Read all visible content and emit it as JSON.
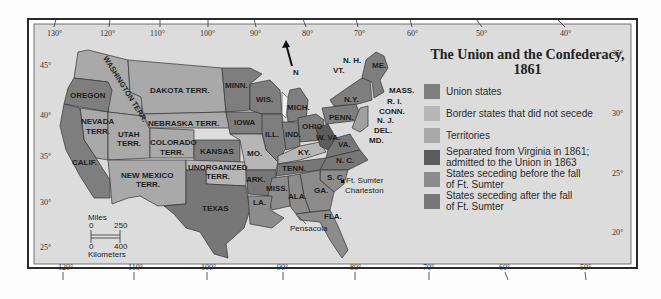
{
  "map": {
    "title_line1": "The Union and the Confederacy,",
    "title_line2": "1861",
    "north_label": "N",
    "colors": {
      "background": "#dcdcdc",
      "union": "#7e7e7e",
      "border": "#b6b6b6",
      "territories": "#a9a9a9",
      "west_virginia": "#5c5c5c",
      "seceding_before": "#8c8c8c",
      "seceding_after": "#777777",
      "frame": "#2a2a2a"
    },
    "legend": [
      {
        "label": "Union states",
        "color": "#7e7e7e"
      },
      {
        "label": "Border states that did not secede",
        "color": "#b6b6b6"
      },
      {
        "label": "Territories",
        "color": "#a9a9a9"
      },
      {
        "label": "Separated from Virginia in 1861; admitted to the Union in 1863",
        "label_l1": "Separated from Virginia in 1861;",
        "label_l2": "admitted to the Union in 1863",
        "color": "#5c5c5c"
      },
      {
        "label": "States seceding before the fall of Ft. Sumter",
        "label_l1": "States seceding before the fall",
        "label_l2": "of Ft. Sumter",
        "color": "#8c8c8c"
      },
      {
        "label": "States seceding after the fall of Ft. Sumter",
        "label_l1": "States seceding after the fall",
        "label_l2": "of Ft. Sumter",
        "color": "#777777"
      }
    ],
    "top_longitudes": [
      "130°",
      "120°",
      "110°",
      "100°",
      "90°",
      "80°",
      "70°",
      "60°",
      "50°",
      "40°"
    ],
    "bottom_longitudes": [
      "120°",
      "110°",
      "100°",
      "90°",
      "80°",
      "70°",
      "60°",
      "50°"
    ],
    "left_latitudes": [
      "45°",
      "40°",
      "35°",
      "30°",
      "25°"
    ],
    "right_latitudes": [
      "35°",
      "30°",
      "25°",
      "20°"
    ],
    "scale": {
      "miles_label": "Miles",
      "miles_0": "0",
      "miles_max": "250",
      "km_0": "0",
      "km_max": "400",
      "km_label": "Kilometers"
    },
    "regions": {
      "washington": "WASHINGTON TERR.",
      "oregon": "OREGON",
      "dakota": "DAKOTA TERR.",
      "nevada_1": "NEVADA",
      "nevada_2": "TERR.",
      "utah_1": "UTAH",
      "utah_2": "TERR.",
      "nebraska": "NEBRASKA TERR.",
      "colorado_1": "COLORADO",
      "colorado_2": "TERR.",
      "calif": "CALIF.",
      "new_mexico_1": "NEW MEXICO",
      "new_mexico_2": "TERR.",
      "kansas": "KANSAS",
      "unorganized_1": "UNORGANIZED",
      "unorganized_2": "TERR.",
      "texas": "TEXAS",
      "minn": "MINN.",
      "wis": "WIS.",
      "iowa": "IOWA",
      "mich": "MICH.",
      "ill": "ILL.",
      "ind": "IND.",
      "ohio": "OHIO",
      "mo": "MO.",
      "ky": "KY.",
      "w_va": "W. VA.",
      "va": "VA.",
      "penn": "PENN.",
      "ny": "N.Y.",
      "vt": "VT.",
      "nh": "N. H.",
      "me": "ME.",
      "mass": "MASS.",
      "ri": "R. I.",
      "conn": "CONN.",
      "nj": "N. J.",
      "del": "DEL.",
      "md": "MD.",
      "nc": "N. C.",
      "sc": "S. C.",
      "tenn": "TENN.",
      "ark": "ARK.",
      "miss": "MISS.",
      "ala": "ALA.",
      "ga": "GA.",
      "la": "LA.",
      "fla": "FLA."
    },
    "places": {
      "ft_sumter": "Ft. Sumter",
      "charleston": "Charleston",
      "pensacola": "Pensacola"
    }
  }
}
